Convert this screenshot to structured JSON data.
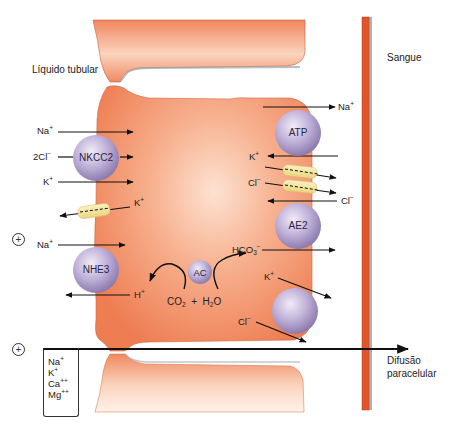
{
  "diagram": {
    "title_labels": {
      "lumen": "Líquido tubular",
      "blood": "Sangue",
      "paracellular": [
        "Difusão",
        "paracelular"
      ]
    },
    "colors": {
      "cell": "#f08a62",
      "cell_light": "#fbd6c2",
      "blood_vessel": "#e0552a",
      "protein": "#b7a8d0",
      "channel": "#f3e3a0",
      "arrow": "#111111"
    },
    "proteins": {
      "nkcc2": "NKCC2",
      "nhe3": "NHE3",
      "atp": "ATP",
      "ae2": "AE2",
      "ac": "AC",
      "kcl": ""
    },
    "apical_ions": {
      "na1": "Na",
      "na1_sup": "+",
      "cl2": "2Cl",
      "cl2_sup": "−",
      "k1": "K",
      "k1_sup": "+",
      "k_out": "K",
      "k_out_sup": "+",
      "na2": "Na",
      "na2_sup": "+",
      "h": "H",
      "h_sup": "+"
    },
    "basolateral_ions": {
      "na": "Na",
      "na_sup": "+",
      "k": "K",
      "k_sup": "+",
      "cl_ch": "Cl",
      "cl_ch_sup": "−",
      "cl_in": "Cl",
      "cl_in_sup": "−",
      "hco3": "HCO",
      "hco3_sub": "3",
      "hco3_sup": "−",
      "k2": "K",
      "k2_sup": "+",
      "cl2": "Cl",
      "cl2_sup": "−"
    },
    "reaction": {
      "co2": "CO",
      "co2_sub": "2",
      "plus": "+",
      "h2o_h": "H",
      "h2o_sub": "2",
      "h2o_o": "O"
    },
    "lumen_potential": [
      "+",
      "+"
    ],
    "paracellular_ions": [
      {
        "ion": "Na",
        "charge": "+"
      },
      {
        "ion": "K",
        "charge": "+"
      },
      {
        "ion": "Ca",
        "charge": "++"
      },
      {
        "ion": "Mg",
        "charge": "++"
      }
    ]
  }
}
